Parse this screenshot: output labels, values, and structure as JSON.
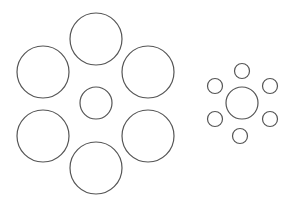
{
  "diagram": {
    "stroke_color": "#555555",
    "background": "#ffffff",
    "left_group": {
      "center": {
        "cx": 96,
        "cy": 103,
        "r": 16
      },
      "surround": [
        {
          "cx": 96,
          "cy": 39,
          "r": 26
        },
        {
          "cx": 43,
          "cy": 72,
          "r": 26
        },
        {
          "cx": 148,
          "cy": 72,
          "r": 26
        },
        {
          "cx": 43,
          "cy": 136,
          "r": 26
        },
        {
          "cx": 148,
          "cy": 136,
          "r": 26
        },
        {
          "cx": 96,
          "cy": 168,
          "r": 26
        }
      ]
    },
    "right_group": {
      "center": {
        "cx": 242,
        "cy": 103,
        "r": 16
      },
      "surround": [
        {
          "cx": 242,
          "cy": 71,
          "r": 7.5
        },
        {
          "cx": 215,
          "cy": 86,
          "r": 7.5
        },
        {
          "cx": 270,
          "cy": 86,
          "r": 7.5
        },
        {
          "cx": 215,
          "cy": 119,
          "r": 7.5
        },
        {
          "cx": 270,
          "cy": 119,
          "r": 7.5
        },
        {
          "cx": 240,
          "cy": 136,
          "r": 7.5
        }
      ]
    }
  }
}
